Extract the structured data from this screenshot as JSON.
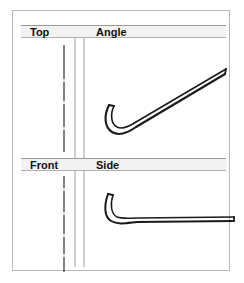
{
  "figure": {
    "type": "orthographic-views",
    "background_color": "#ffffff",
    "frame_color": "#b9b9b9",
    "band_color": "#f2f2f2",
    "line_color": "#1a1a1a",
    "guide_color": "#cfcfcf"
  },
  "panels": {
    "top": {
      "label": "Top"
    },
    "angle": {
      "label": "Angle"
    },
    "front": {
      "label": "Front"
    },
    "side": {
      "label": "Side"
    }
  },
  "icons": {
    "top_centerline": "vertical-centerline-icon",
    "front_centerline": "vertical-centerline-icon",
    "angle_outline": "hook-instrument-angled-icon",
    "side_outline": "hook-instrument-side-icon",
    "divider": "vertical-divider-icon"
  }
}
